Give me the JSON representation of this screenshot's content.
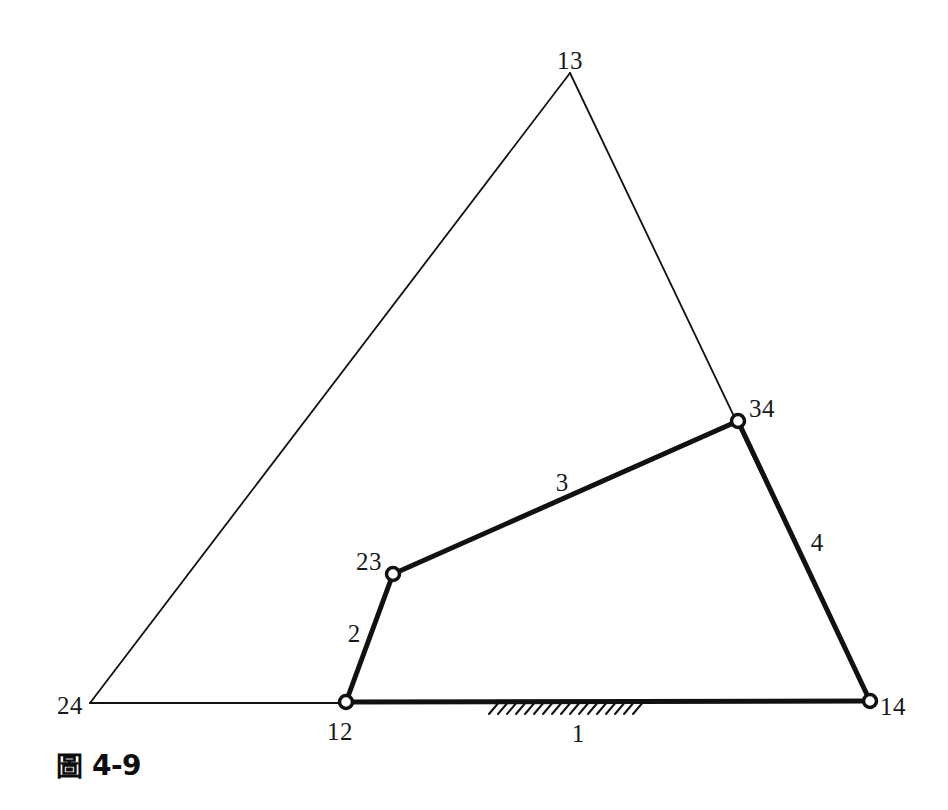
{
  "figure": {
    "caption_prefix": "圖",
    "caption_number": "4-9",
    "title": "圖 4-9",
    "type": "four-bar linkage instant-center diagram",
    "background_color": "#ffffff",
    "line_color": "#111111"
  },
  "joints": [
    {
      "id": "12",
      "label": "12",
      "x": 346,
      "y": 703,
      "label_x": 340,
      "label_y": 731,
      "kind": "pin-joint-ground",
      "marker": "open-circle"
    },
    {
      "id": "23",
      "label": "23",
      "x": 393,
      "y": 574,
      "label_x": 369,
      "label_y": 561,
      "kind": "pin-joint",
      "marker": "open-circle"
    },
    {
      "id": "34",
      "label": "34",
      "x": 738,
      "y": 421,
      "label_x": 762,
      "label_y": 408,
      "kind": "pin-joint",
      "marker": "open-circle"
    },
    {
      "id": "14",
      "label": "14",
      "x": 870,
      "y": 701,
      "label_x": 893,
      "label_y": 706,
      "kind": "pin-joint-ground",
      "marker": "open-circle"
    },
    {
      "id": "13",
      "label": "13",
      "x": 570,
      "y": 73,
      "label_x": 570,
      "label_y": 60,
      "kind": "instant-center",
      "marker": "none"
    },
    {
      "id": "24",
      "label": "24",
      "x": 90,
      "y": 703,
      "label_x": 70,
      "label_y": 705,
      "kind": "instant-center",
      "marker": "none"
    }
  ],
  "links": [
    {
      "id": "1",
      "label": "1",
      "from": "12",
      "to": "14",
      "weight": "thick",
      "label_x": 578,
      "label_y": 733,
      "description": "ground link"
    },
    {
      "id": "2",
      "label": "2",
      "from": "12",
      "to": "23",
      "weight": "thick",
      "label_x": 354,
      "label_y": 633,
      "description": "input crank"
    },
    {
      "id": "3",
      "label": "3",
      "from": "23",
      "to": "34",
      "weight": "thick",
      "label_x": 562,
      "label_y": 482,
      "description": "coupler"
    },
    {
      "id": "4",
      "label": "4",
      "from": "34",
      "to": "14",
      "weight": "thick",
      "label_x": 817,
      "label_y": 542,
      "description": "output link"
    }
  ],
  "construction_lines": [
    {
      "id": "line-24-13",
      "from": "24",
      "through": "23",
      "to": "13",
      "weight": "thin",
      "description": "line through instant center 24 and joint 23 to instant center 13"
    },
    {
      "id": "line-13-14",
      "from": "13",
      "through": "34",
      "to": "14",
      "weight": "thin",
      "description": "line through instant center 13 and joint 34 to joint 14"
    },
    {
      "id": "line-24-12",
      "from": "24",
      "to": "12",
      "weight": "thin",
      "description": "ground line extension to instant center 24"
    }
  ],
  "ground_hatch": {
    "id": "ground-hatching",
    "x_start": 495,
    "x_end": 646,
    "y": 701,
    "tick_count": 17,
    "description": "fixed-ground hatch marks below link 1"
  }
}
